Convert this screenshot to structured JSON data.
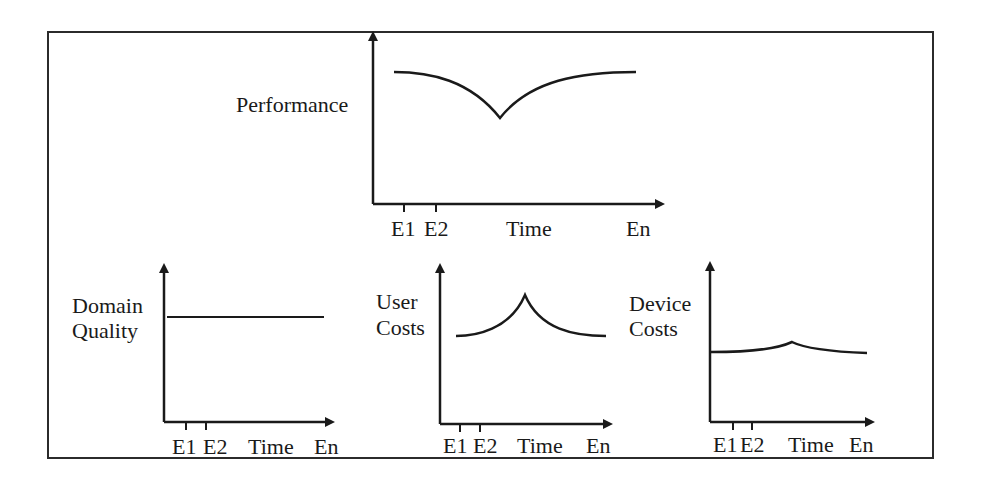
{
  "figure": {
    "panels": {
      "performance": {
        "ylabel": "Performance",
        "xticks": [
          "E1",
          "E2",
          "Time",
          "En"
        ]
      },
      "domain_quality": {
        "ylabel_line1": "Domain",
        "ylabel_line2": "Quality",
        "xticks": [
          "E1",
          "E2",
          "Time",
          "En"
        ]
      },
      "user_costs": {
        "ylabel_line1": "User",
        "ylabel_line2": "Costs",
        "xticks": [
          "E1",
          "E2",
          "Time",
          "En"
        ]
      },
      "device_costs": {
        "ylabel_line1": "Device",
        "ylabel_line2": "Costs",
        "xticks": [
          "E1",
          "E2",
          "Time",
          "En"
        ]
      }
    },
    "colors": {
      "ink": "#1a1a1a",
      "frame": "#2b2b2b",
      "background": "#ffffff"
    }
  }
}
